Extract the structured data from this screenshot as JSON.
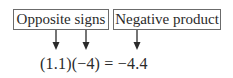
{
  "labels": {
    "opposite_signs": "Opposite signs",
    "negative_product": "Negative product"
  },
  "equation": {
    "factor1": "(1.1)",
    "factor2": "(−4)",
    "equals": " = ",
    "result": "−4.4"
  },
  "arrows": [
    {
      "from": "opposite_signs",
      "to": "factor1"
    },
    {
      "from": "opposite_signs",
      "to": "factor2"
    },
    {
      "from": "negative_product",
      "to": "result"
    }
  ],
  "colors": {
    "border": "#6b6b6b",
    "text": "#2a2a2a"
  }
}
